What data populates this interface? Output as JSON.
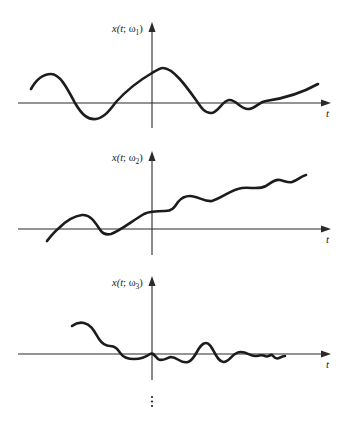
{
  "figure": {
    "colors": {
      "axis": "#2a2a2a",
      "curve": "#1c1c1c",
      "background": "#ffffff"
    },
    "panels": [
      {
        "id": "panel-1",
        "ylabel_prefix": "x(",
        "ylabel_t": "t",
        "ylabel_sep": "; ω",
        "ylabel_sub": "1",
        "ylabel_suffix": ")",
        "xlabel": "t"
      },
      {
        "id": "panel-2",
        "ylabel_prefix": "x(",
        "ylabel_t": "t",
        "ylabel_sep": "; ω",
        "ylabel_sub": "2",
        "ylabel_suffix": ")",
        "xlabel": "t"
      },
      {
        "id": "panel-3",
        "ylabel_prefix": "x(",
        "ylabel_t": "t",
        "ylabel_sep": "; ω",
        "ylabel_sub": "3",
        "ylabel_suffix": ")",
        "xlabel": "t"
      }
    ],
    "continuation": "⋮"
  }
}
